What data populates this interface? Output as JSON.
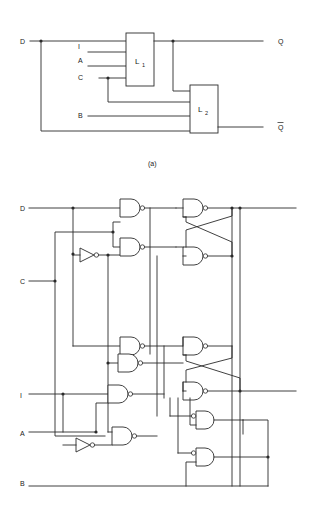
{
  "figure": {
    "type": "logic-circuit-schematic",
    "caption_a": "(a)",
    "panels": [
      {
        "id": "a",
        "name": "block-level-latch-diagram",
        "caption": "(a)",
        "blocks": [
          {
            "label": "L",
            "subscript": "1",
            "name": "latch-l1"
          },
          {
            "label": "L",
            "subscript": "2",
            "name": "latch-l2"
          }
        ],
        "inputs": [
          {
            "label": "D",
            "name": "input-d"
          },
          {
            "label": "I",
            "name": "input-i"
          },
          {
            "label": "A",
            "name": "input-a"
          },
          {
            "label": "C",
            "name": "input-c"
          },
          {
            "label": "B",
            "name": "input-b"
          }
        ],
        "outputs": [
          {
            "label": "Q",
            "overbar": false,
            "name": "output-q"
          },
          {
            "label": "Q",
            "overbar": true,
            "name": "output-q-bar"
          }
        ]
      },
      {
        "id": "b",
        "name": "gate-level-latch-diagram",
        "caption": "",
        "inputs": [
          {
            "label": "D",
            "name": "input-d"
          },
          {
            "label": "C",
            "name": "input-c"
          },
          {
            "label": "I",
            "name": "input-i"
          },
          {
            "label": "A",
            "name": "input-a"
          },
          {
            "label": "B",
            "name": "input-b"
          }
        ],
        "gate_counts": {
          "nand": 8,
          "and_inverted_input": 2,
          "inverter": 2
        },
        "outputs": [
          {
            "label": "",
            "name": "output-q-line"
          },
          {
            "label": "",
            "name": "output-q-bar-line"
          }
        ]
      }
    ],
    "colors": {
      "line": "#2b2b2b",
      "text": "#1a1a1a",
      "background": "#ffffff"
    }
  }
}
